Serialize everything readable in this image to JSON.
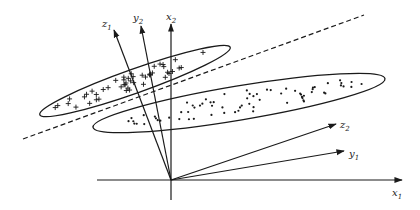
{
  "diagram": {
    "origin": [
      171,
      180
    ],
    "axes": [
      {
        "name": "x1",
        "label": "x",
        "sub": "1",
        "tip": [
          402,
          180
        ],
        "label_pos": [
          392,
          196
        ]
      },
      {
        "name": "y1",
        "label": "y",
        "sub": "1",
        "tip": [
          344,
          151
        ],
        "label_pos": [
          349,
          157
        ]
      },
      {
        "name": "z2",
        "label": "z",
        "sub": "2",
        "tip": [
          336,
          124
        ],
        "label_pos": [
          340,
          128
        ]
      },
      {
        "name": "x2",
        "label": "x",
        "sub": "2",
        "tip": [
          171,
          24
        ],
        "label_pos": [
          166,
          20
        ]
      },
      {
        "name": "y2",
        "label": "y",
        "sub": "2",
        "tip": [
          141,
          26
        ],
        "label_pos": [
          133,
          21
        ]
      },
      {
        "name": "z1",
        "label": "z",
        "sub": "1",
        "tip": [
          114,
          30
        ],
        "label_pos": [
          102,
          27
        ]
      }
    ],
    "x1_axis_start": [
      97,
      180
    ],
    "vertical_axis_bottom": [
      171,
      200
    ],
    "separator": {
      "style": "dashed",
      "from": [
        23,
        139
      ],
      "to": [
        364,
        15
      ]
    },
    "clusters": [
      {
        "name": "plus-cluster",
        "marker": "+",
        "ellipse": {
          "cx": 135,
          "cy": 81,
          "rx": 101,
          "ry": 12,
          "angle": -19.5
        }
      },
      {
        "name": "dot-cluster",
        "marker": "•",
        "ellipse": {
          "cx": 239,
          "cy": 103,
          "rx": 148,
          "ry": 17,
          "angle": -9.5
        }
      }
    ]
  }
}
